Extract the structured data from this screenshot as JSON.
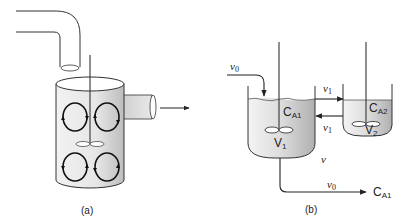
{
  "figure": {
    "panel_a": {
      "caption": "(a)",
      "description": "Stirred tank with inlet pipe, impeller, four circulation loops and side outlet"
    },
    "panel_b": {
      "caption": "(b)",
      "inlet_flow": "v",
      "inlet_flow_sub": "0",
      "tank1": {
        "conc": "C",
        "conc_sub": "A1",
        "vol": "V",
        "vol_sub": "1"
      },
      "tank2": {
        "conc": "C",
        "conc_sub": "A2",
        "vol": "V",
        "vol_sub": "2"
      },
      "flow_to_tank2": "v",
      "flow_to_tank2_sub": "1",
      "flow_back": "v",
      "flow_back_sub": "1",
      "mid_label": "v",
      "outlet_flow": "v",
      "outlet_flow_sub": "0",
      "outlet_conc": "C",
      "outlet_conc_sub": "A1"
    },
    "colors": {
      "line": "#222222",
      "fill_gray": "#c8c8c8"
    }
  }
}
